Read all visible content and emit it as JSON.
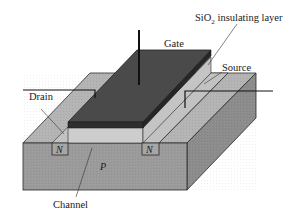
{
  "diagram": {
    "labels": {
      "sio2_prefix": "SiO",
      "sio2_sub": "2",
      "sio2_suffix": " insulating layer",
      "gate": "Gate",
      "source": "Source",
      "drain": "Drain",
      "channel": "Channel",
      "substrate": "P",
      "n_left": "N",
      "n_right": "N"
    },
    "colors": {
      "background": "#ffffff",
      "substrate_front": "#9a9a9a",
      "substrate_top": "#b4b4b4",
      "substrate_side": "#8a8a8a",
      "gate_top": "#4a4a4a",
      "gate_front": "#2e2e2e",
      "gate_side": "#242424",
      "oxide": "#cdcdcd",
      "outline": "#2a2a2a",
      "wire": "#111111"
    }
  }
}
